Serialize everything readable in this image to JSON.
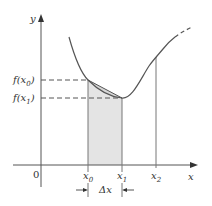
{
  "figure": {
    "type": "secant-approximation-diagram",
    "axes": {
      "x_label": "x",
      "y_label": "y",
      "origin_label": "0"
    },
    "x_ticks": [
      {
        "label_base": "x",
        "label_sub": "0",
        "id": "x0"
      },
      {
        "label_base": "x",
        "label_sub": "1",
        "id": "x1"
      },
      {
        "label_base": "x",
        "label_sub": "2",
        "id": "x2"
      }
    ],
    "y_ticks": [
      {
        "label": "f(x₀)",
        "label_base": "f(x",
        "label_sub": "0",
        "label_close": ")",
        "id": "f_x0"
      },
      {
        "label": "f(x₁)",
        "label_base": "f(x",
        "label_sub": "1",
        "label_close": ")",
        "id": "f_x1"
      }
    ],
    "interval_label": "Δx",
    "shaded_region": "area under chord between x0 and x1",
    "colors": {
      "line": "#555555",
      "shade": "#e4e4e4",
      "text": "#333333",
      "background": "#ffffff"
    }
  }
}
